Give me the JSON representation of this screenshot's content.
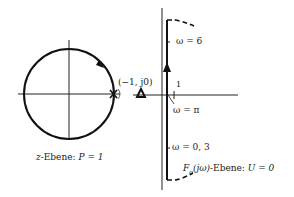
{
  "left_plot": {
    "caption": "z-Ebene: P = 1",
    "caption_italic_part": "z",
    "caption_rest": "-Ebene: ",
    "caption_math": "P = 1",
    "circle": {
      "center": [
        69,
        94
      ],
      "radius": 46
    },
    "pole_marker": "×",
    "point_label": "(−1, j0)"
  },
  "right_plot": {
    "caption_math": "F",
    "caption_sub": "o",
    "caption_arg": "(jω)",
    "caption_rest": "-Ebene: ",
    "caption_value": "U = 0",
    "tick_label_1": "1",
    "omega_labels": {
      "w6": "ω = 6",
      "wpi": "ω = π",
      "w03": "ω = 0, 3"
    }
  },
  "colors": {
    "line": "#111111",
    "text": "#222222"
  }
}
